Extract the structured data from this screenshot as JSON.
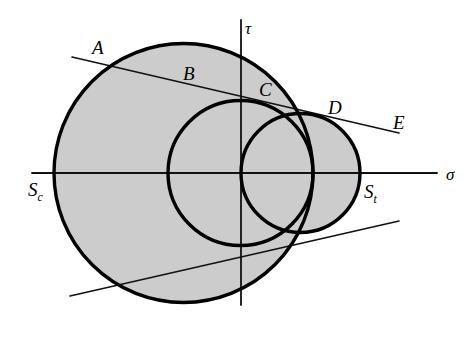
{
  "figure": {
    "type": "mohr-circle-diagram",
    "background_color": "#ffffff",
    "circle_fill_color": "#cccccc",
    "stroke_color": "#000000"
  },
  "axes": {
    "horizontal": {
      "name": "sigma-axis",
      "label": "σ",
      "label_x": 446,
      "label_y": 173,
      "x1": 32,
      "y1": 173,
      "x2": 437,
      "y2": 173
    },
    "vertical": {
      "name": "tau-axis",
      "label": "τ",
      "label_x": 245,
      "label_y": 27,
      "x1": 241,
      "y1": 20,
      "x2": 241,
      "y2": 305
    },
    "origin": {
      "x": 241,
      "y": 173
    }
  },
  "circles": [
    {
      "name": "compression-circle",
      "cx": 183.5,
      "cy": 173,
      "r": 129.5,
      "left_intercept": 54,
      "right_intercept": 313
    },
    {
      "name": "middle-circle",
      "cx": 240.5,
      "cy": 173,
      "r": 72.5,
      "left_intercept": 168,
      "right_intercept": 313
    },
    {
      "name": "tension-circle",
      "cx": 300.5,
      "cy": 173,
      "r": 59.5,
      "left_intercept": 241,
      "right_intercept": 360
    }
  ],
  "tangent_lines": [
    {
      "name": "upper-tangent-line",
      "x1": 72,
      "y1": 57,
      "x2": 399,
      "y2": 133
    },
    {
      "name": "lower-tangent-line",
      "x1": 70,
      "y1": 296,
      "x2": 399,
      "y2": 221
    }
  ],
  "labels": {
    "A": {
      "text": "A",
      "x": 92,
      "y": 38
    },
    "B": {
      "text": "B",
      "x": 183,
      "y": 64
    },
    "C": {
      "text": "C",
      "x": 259,
      "y": 80
    },
    "D": {
      "text": "D",
      "x": 328,
      "y": 98
    },
    "E": {
      "text": "E",
      "x": 393,
      "y": 113
    },
    "tau": {
      "text": "τ",
      "x": 245,
      "y": 20
    },
    "sigma": {
      "text": "σ",
      "x": 446,
      "y": 166
    },
    "Sc": {
      "text": "S",
      "sub": "c",
      "x": 28,
      "y": 180
    },
    "St": {
      "text": "S",
      "sub": "t",
      "x": 364,
      "y": 182
    }
  }
}
